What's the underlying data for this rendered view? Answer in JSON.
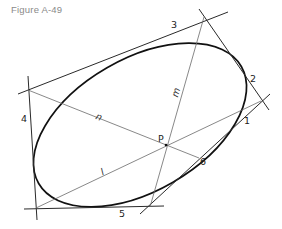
{
  "figure": {
    "caption": "Figure A-49",
    "point_label": "P",
    "tangent_labels": [
      "1",
      "2",
      "3",
      "4",
      "5",
      "6"
    ],
    "chord_labels": {
      "n": "n",
      "m": "m",
      "l": "l"
    }
  }
}
